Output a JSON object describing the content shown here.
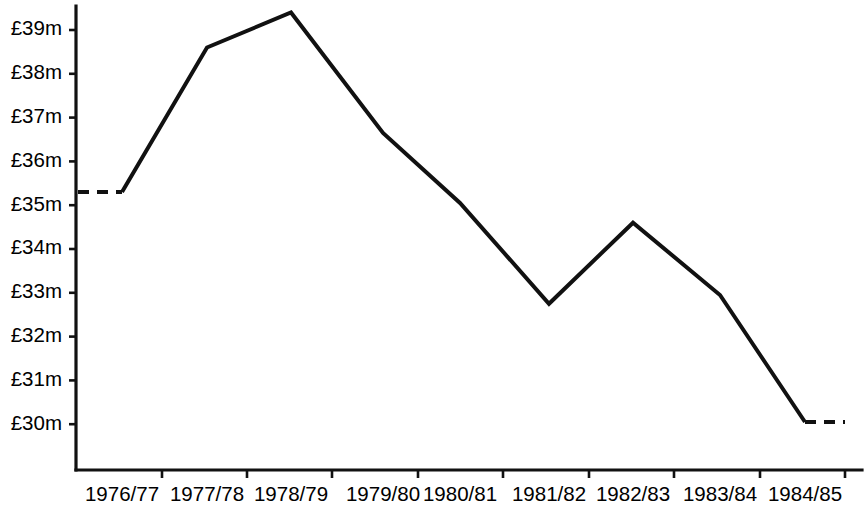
{
  "chart_data": {
    "type": "line",
    "title": "",
    "subtitle": "",
    "xlabel": "",
    "ylabel": "",
    "categories": [
      "1976/77",
      "1977/78",
      "1978/79",
      "1979/80",
      "1980/81",
      "1981/82",
      "1982/83",
      "1983/84",
      "1984/85"
    ],
    "values": [
      35.3,
      38.6,
      39.4,
      36.65,
      35.05,
      32.75,
      34.6,
      32.95,
      30.05
    ],
    "series": [
      {
        "name": "",
        "values": [
          35.3,
          38.6,
          39.4,
          36.65,
          35.05,
          32.75,
          34.6,
          32.95,
          30.05
        ]
      }
    ],
    "ylim": [
      29.4,
      39.6
    ],
    "ytick_values": [
      39,
      38,
      37,
      36,
      35,
      34,
      33,
      32,
      31,
      30
    ],
    "ytick_labels": [
      "£39m",
      "£38m",
      "£37m",
      "£36m",
      "£35m",
      "£34m",
      "£33m",
      "£32m",
      "£31m",
      "£30m"
    ],
    "xtick_labels": [
      "1976/77",
      "1977/78",
      "1978/79",
      "1979/80",
      "1980/81",
      "1981/82",
      "1982/83",
      "1983/84",
      "1984/85"
    ],
    "grid": false,
    "legend": null,
    "legend_position": "none",
    "annotations": [],
    "line_style": "solid",
    "line_color": "#111111",
    "leader_segments": [
      {
        "name": "left-dashed-leader",
        "style": "dashed",
        "from_value": 35.3,
        "to_value": 35.3
      },
      {
        "name": "right-dashed-trailer",
        "style": "dashed",
        "from_value": 30.05,
        "to_value": 30.05
      }
    ],
    "currency": "£",
    "units": "m"
  },
  "geometry": {
    "plot_left": 76,
    "plot_right": 862,
    "axis_bottom": 470,
    "axis_top": 6,
    "y_top_value": 39,
    "y_top_px": 30,
    "px_per_unit": 43.8,
    "point_x": [
      122,
      207,
      291,
      383,
      460,
      549,
      633,
      720,
      805
    ],
    "xtick_x": [
      162,
      247,
      332,
      418,
      503,
      589,
      674,
      760,
      845
    ],
    "dash_left_x": 78,
    "dash_right_x": 845,
    "ylabel_x": 62,
    "xlabel_y": 496
  },
  "colors": {
    "background": "#ffffff",
    "ink": "#111111",
    "text": "#000000"
  }
}
